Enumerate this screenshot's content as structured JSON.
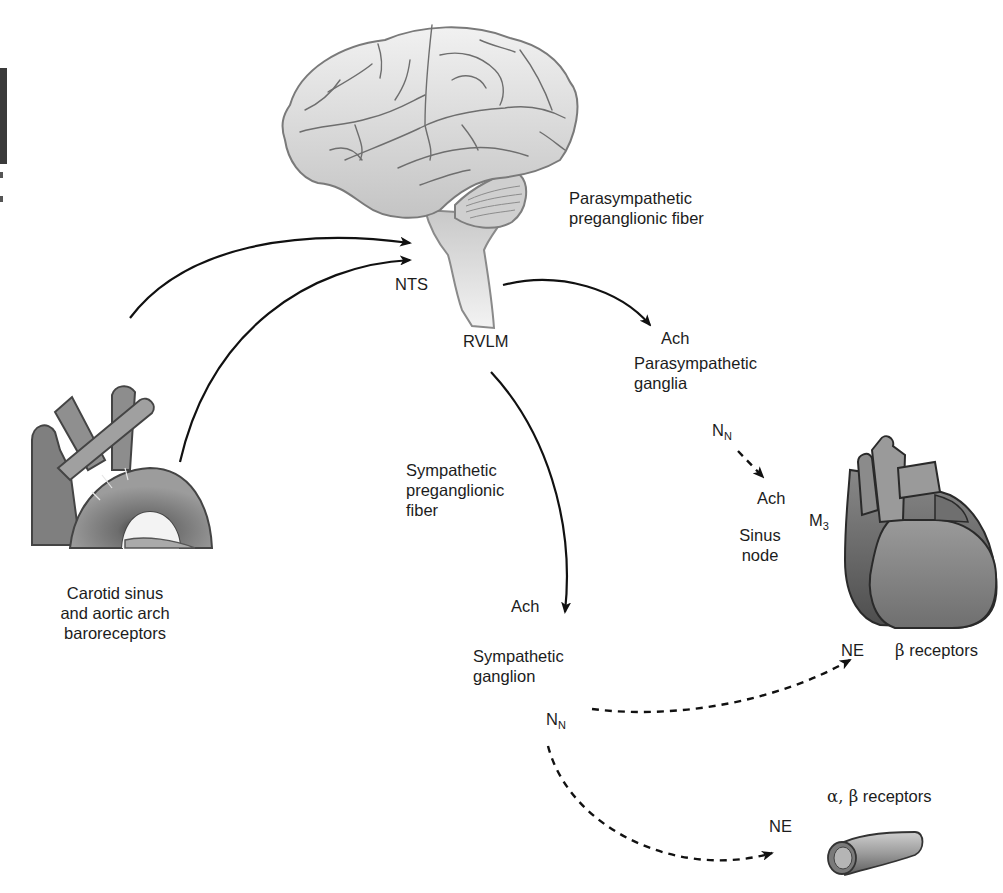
{
  "figure": {
    "brain": {
      "icon": "brain-icon"
    },
    "baroreceptor_vessels": {
      "icon": "aortic-arch-icon"
    },
    "heart": {
      "icon": "heart-icon"
    },
    "vessel": {
      "icon": "blood-vessel-icon"
    }
  },
  "labels": {
    "nts": "NTS",
    "rvlm": "RVLM",
    "parasym_pre_line1": "Parasympathetic",
    "parasym_pre_line2": "preganglionic fiber",
    "parasym_ach": "Ach",
    "parasym_ganglia_line1": "Parasympathetic",
    "parasym_ganglia_line2": "ganglia",
    "parasym_nn": "N",
    "parasym_nn_sub": "N",
    "sinus_ach": "Ach",
    "sinus_node_line1": "Sinus",
    "sinus_node_line2": "node",
    "m3": "M",
    "m3_sub": "3",
    "baro_line1": "Carotid sinus",
    "baro_line2": "and aortic arch",
    "baro_line3": "baroreceptors",
    "sym_pre_line1": "Sympathetic",
    "sym_pre_line2": "preganglionic",
    "sym_pre_line3": "fiber",
    "sym_ach": "Ach",
    "sym_ganglion_line1": "Sympathetic",
    "sym_ganglion_line2": "ganglion",
    "sym_nn": "N",
    "sym_nn_sub": "N",
    "heart_ne": "NE",
    "heart_beta": "β",
    "heart_receptors": " receptors",
    "vessel_ne": "NE",
    "vessel_alpha_beta": "α, β",
    "vessel_receptors": " receptors"
  },
  "colors": {
    "brain_fill": "#d9d9d9",
    "brain_stroke": "#7a7a7a",
    "organ_fill": "#8a8a8a",
    "organ_dark": "#5a5a5a",
    "arrow": "#111111"
  }
}
